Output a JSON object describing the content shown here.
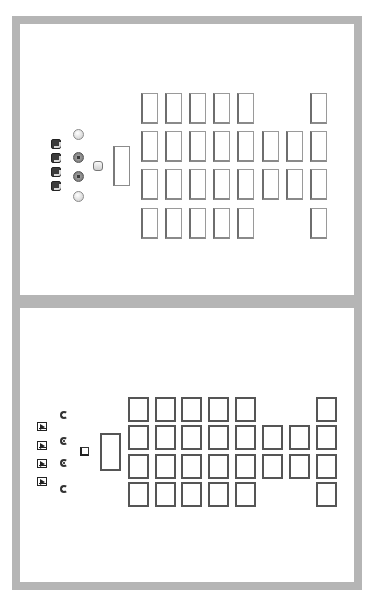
{
  "panels": [
    {
      "id": "top",
      "style": "shaded",
      "frame": {
        "x": 12,
        "y": 16,
        "w": 350,
        "h": 287
      },
      "seat_size": {
        "w": 17,
        "h": 31
      },
      "seat_columns_x": [
        141,
        165,
        189,
        213,
        237,
        262,
        286,
        310
      ],
      "seat_rows_y": [
        93,
        131,
        169,
        208
      ],
      "seat_pattern": [
        [
          1,
          1,
          1,
          1,
          1,
          0,
          0,
          1
        ],
        [
          1,
          1,
          1,
          1,
          1,
          1,
          1,
          1
        ],
        [
          1,
          1,
          1,
          1,
          1,
          1,
          1,
          1
        ],
        [
          1,
          1,
          1,
          1,
          1,
          0,
          0,
          1
        ]
      ],
      "lectern": {
        "x": 113,
        "y": 146
      },
      "small_square": {
        "x": 93,
        "y": 161
      },
      "radios": [
        {
          "x": 73,
          "y": 129,
          "selected": false
        },
        {
          "x": 73,
          "y": 152,
          "selected": true
        },
        {
          "x": 73,
          "y": 171,
          "selected": true
        },
        {
          "x": 73,
          "y": 191,
          "selected": false
        }
      ],
      "checkboxes": [
        {
          "x": 51,
          "y": 139
        },
        {
          "x": 51,
          "y": 153
        },
        {
          "x": 51,
          "y": 167
        },
        {
          "x": 51,
          "y": 181
        }
      ]
    },
    {
      "id": "bottom",
      "style": "flat",
      "frame": {
        "x": 12,
        "y": 300,
        "w": 350,
        "h": 290
      },
      "seat_size": {
        "w": 21,
        "h": 25
      },
      "seat_columns_x": [
        128,
        155,
        181,
        208,
        235,
        262,
        289,
        316
      ],
      "seat_rows_y": [
        397,
        425,
        454,
        482
      ],
      "seat_pattern": [
        [
          1,
          1,
          1,
          1,
          1,
          0,
          0,
          1
        ],
        [
          1,
          1,
          1,
          1,
          1,
          1,
          1,
          1
        ],
        [
          1,
          1,
          1,
          1,
          1,
          1,
          1,
          1
        ],
        [
          1,
          1,
          1,
          1,
          1,
          0,
          0,
          1
        ]
      ],
      "lectern": {
        "x": 100,
        "y": 433
      },
      "small_square": {
        "x": 80,
        "y": 447
      },
      "radios": [
        {
          "x": 60,
          "y": 411,
          "selected": false
        },
        {
          "x": 60,
          "y": 437,
          "selected": true
        },
        {
          "x": 60,
          "y": 459,
          "selected": true
        },
        {
          "x": 60,
          "y": 485,
          "selected": false
        }
      ],
      "checkboxes": [
        {
          "x": 37,
          "y": 422
        },
        {
          "x": 37,
          "y": 441
        },
        {
          "x": 37,
          "y": 459
        },
        {
          "x": 37,
          "y": 477
        }
      ]
    }
  ],
  "colors": {
    "frame": "#b5b5b5",
    "background": "#ffffff",
    "outline": "#555555"
  }
}
